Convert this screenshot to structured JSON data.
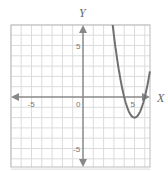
{
  "chart_data": {
    "type": "line",
    "title": "",
    "xlabel": "X",
    "ylabel": "Y",
    "xlim": [
      -7,
      6.5
    ],
    "ylim": [
      -7,
      7
    ],
    "grid": true,
    "x_ticks": [
      {
        "value": -5,
        "label": "-5"
      },
      {
        "value": 0,
        "label": "0"
      },
      {
        "value": 5,
        "label": "5"
      }
    ],
    "y_ticks": [
      {
        "value": 5,
        "label": "5"
      },
      {
        "value": -5,
        "label": "-5"
      }
    ],
    "series": [
      {
        "name": "parabola",
        "equation": "y = 2(x - 5)^2 - 2",
        "vertex": [
          5,
          -2
        ],
        "x_intercepts": [
          4,
          6
        ],
        "color": "#707070"
      }
    ]
  },
  "colors": {
    "grid": "#dcdcdc",
    "axis": "#888888",
    "curve": "#707070",
    "border": "#bbbbbb"
  }
}
